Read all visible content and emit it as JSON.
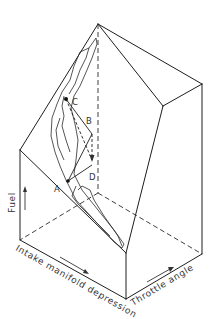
{
  "figure": {
    "type": "isometric-3d-fuel-map",
    "axes": {
      "vertical": {
        "label": "Fuel",
        "arrow": "up"
      },
      "left_base": {
        "label": "Intake manifold depression",
        "arrow": "right-down"
      },
      "right_base": {
        "label": "Throttle angle",
        "arrow": "right-up"
      }
    },
    "points": {
      "A": {
        "label": "A"
      },
      "B": {
        "label": "B"
      },
      "C": {
        "label": "C"
      },
      "D": {
        "label": "D"
      }
    },
    "colors": {
      "line": "#1e1e1e",
      "text": "#333333",
      "background": "#ffffff"
    }
  }
}
